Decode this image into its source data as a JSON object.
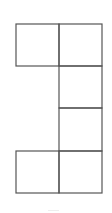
{
  "diagram": {
    "stroke_color": "#555555",
    "background": "#ffffff",
    "cells": [
      {
        "id": "top-left",
        "x": 16,
        "y": 24,
        "w": 43,
        "h": 42
      },
      {
        "id": "top-right",
        "x": 59,
        "y": 24,
        "w": 43,
        "h": 42
      },
      {
        "id": "mid-upper-right",
        "x": 59,
        "y": 66,
        "w": 43,
        "h": 42
      },
      {
        "id": "mid-lower-right",
        "x": 59,
        "y": 108,
        "w": 43,
        "h": 43
      },
      {
        "id": "bottom-left",
        "x": 16,
        "y": 151,
        "w": 43,
        "h": 42
      },
      {
        "id": "bottom-right",
        "x": 59,
        "y": 151,
        "w": 43,
        "h": 42
      }
    ]
  }
}
